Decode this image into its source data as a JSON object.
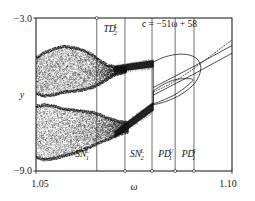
{
  "figure": {
    "name": "bifurcation-diagram",
    "background": "#ffffff",
    "ink": "#111111"
  },
  "annotation": {
    "equation": "c = −51ω + 58"
  },
  "axes": {
    "x": {
      "label": "ω",
      "min": 1.05,
      "max": 1.1,
      "tick_labels": [
        "1.05",
        "1.10"
      ],
      "ticks": [
        1.05,
        1.1
      ]
    },
    "y": {
      "label": "y",
      "min": -9.0,
      "max": -3.0,
      "tick_labels": [
        "−3.0",
        "−9.0"
      ],
      "ticks": [
        -3.0,
        -9.0
      ]
    }
  },
  "bifurcation_markers": [
    {
      "id": "TD2L",
      "base": "TD",
      "sub": "2",
      "sup": "L",
      "omega": 1.0655,
      "label_x": 1.0672,
      "label_y": -3.55,
      "line_from": -3.0,
      "line_to": -9.0,
      "tick_top": true,
      "tick_bottom": false
    },
    {
      "id": "SN1L",
      "base": "SN",
      "sub": "1",
      "sup": "L",
      "omega": 1.0727,
      "label_x": 1.06,
      "label_y": -8.45,
      "line_from": -3.0,
      "line_to": -9.0,
      "tick_top": false,
      "tick_bottom": true
    },
    {
      "id": "SN2L",
      "base": "SN",
      "sub": "2",
      "sup": "L",
      "omega": 1.0796,
      "label_x": 1.074,
      "label_y": -8.45,
      "line_from": -3.0,
      "line_to": -9.0,
      "tick_top": false,
      "tick_bottom": true
    },
    {
      "id": "PD1U",
      "base": "PD",
      "sub": "1",
      "sup": "U",
      "omega": 1.0855,
      "label_x": 1.0812,
      "label_y": -8.45,
      "line_from": -3.0,
      "line_to": -9.0,
      "tick_top": false,
      "tick_bottom": true
    },
    {
      "id": "PD1S",
      "base": "PD",
      "sub": "1",
      "sup": "S",
      "omega": 1.0903,
      "label_x": 1.0872,
      "label_y": -8.45,
      "line_from": -3.0,
      "line_to": -9.0,
      "tick_top": false,
      "tick_bottom": true
    }
  ],
  "chart_data": {
    "type": "scatter",
    "title": "",
    "xlabel": "ω",
    "ylabel": "y",
    "xlim": [
      1.05,
      1.1
    ],
    "ylim": [
      -9.0,
      -3.0
    ],
    "grid": false,
    "legend": null,
    "series": [
      {
        "name": "chaotic-attractor-upper-band",
        "style": "dense-cloud",
        "omega_range": [
          1.05,
          1.0735
        ],
        "y_range": [
          -3.95,
          -6.05
        ],
        "points": [
          {
            "omega": 1.05,
            "y_lo": -5.95,
            "y_hi": -4.55
          },
          {
            "omega": 1.052,
            "y_lo": -6.05,
            "y_hi": -4.35
          },
          {
            "omega": 1.0545,
            "y_lo": -6.0,
            "y_hi": -4.2
          },
          {
            "omega": 1.057,
            "y_lo": -5.9,
            "y_hi": -4.1
          },
          {
            "omega": 1.0595,
            "y_lo": -5.85,
            "y_hi": -4.15
          },
          {
            "omega": 1.062,
            "y_lo": -5.8,
            "y_hi": -4.25
          },
          {
            "omega": 1.0645,
            "y_lo": -5.7,
            "y_hi": -4.45
          },
          {
            "omega": 1.0665,
            "y_lo": -5.55,
            "y_hi": -4.7
          },
          {
            "omega": 1.0685,
            "y_lo": -5.35,
            "y_hi": -4.85
          },
          {
            "omega": 1.0705,
            "y_lo": -5.2,
            "y_hi": -4.92
          },
          {
            "omega": 1.073,
            "y_lo": -5.1,
            "y_hi": -4.95
          }
        ]
      },
      {
        "name": "chaotic-attractor-lower-band",
        "style": "dense-cloud",
        "omega_range": [
          1.05,
          1.0735
        ],
        "y_range": [
          -6.35,
          -8.6
        ],
        "points": [
          {
            "omega": 1.05,
            "y_lo": -8.45,
            "y_hi": -6.45
          },
          {
            "omega": 1.052,
            "y_lo": -8.55,
            "y_hi": -6.4
          },
          {
            "omega": 1.0545,
            "y_lo": -8.5,
            "y_hi": -6.45
          },
          {
            "omega": 1.057,
            "y_lo": -8.4,
            "y_hi": -6.55
          },
          {
            "omega": 1.0595,
            "y_lo": -8.3,
            "y_hi": -6.6
          },
          {
            "omega": 1.062,
            "y_lo": -8.15,
            "y_hi": -6.65
          },
          {
            "omega": 1.0645,
            "y_lo": -8.0,
            "y_hi": -6.7
          },
          {
            "omega": 1.0665,
            "y_lo": -7.85,
            "y_hi": -6.8
          },
          {
            "omega": 1.069,
            "y_lo": -7.7,
            "y_hi": -6.95
          },
          {
            "omega": 1.071,
            "y_lo": -7.55,
            "y_hi": -7.05
          },
          {
            "omega": 1.0735,
            "y_lo": -7.45,
            "y_hi": -7.1
          }
        ]
      },
      {
        "name": "period-2-band-upper",
        "style": "thick-band",
        "points": [
          {
            "omega": 1.07,
            "y_lo": -5.12,
            "y_hi": -4.88
          },
          {
            "omega": 1.074,
            "y_lo": -5.05,
            "y_hi": -4.78
          },
          {
            "omega": 1.078,
            "y_lo": -4.97,
            "y_hi": -4.7
          },
          {
            "omega": 1.08,
            "y_lo": -4.92,
            "y_hi": -4.66
          }
        ]
      },
      {
        "name": "period-2-band-lower",
        "style": "thick-band",
        "points": [
          {
            "omega": 1.07,
            "y_lo": -7.7,
            "y_hi": -7.45
          },
          {
            "omega": 1.074,
            "y_lo": -7.3,
            "y_hi": -6.98
          },
          {
            "omega": 1.078,
            "y_lo": -6.85,
            "y_hi": -6.52
          },
          {
            "omega": 1.08,
            "y_lo": -6.62,
            "y_hi": -6.3
          }
        ]
      },
      {
        "name": "outer-loop-solid",
        "style": "solid-curve",
        "points": [
          {
            "omega": 1.08,
            "y": -4.72
          },
          {
            "omega": 1.083,
            "y": -4.52
          },
          {
            "omega": 1.0865,
            "y": -4.42
          },
          {
            "omega": 1.0895,
            "y": -4.47
          },
          {
            "omega": 1.0915,
            "y": -4.68
          },
          {
            "omega": 1.092,
            "y": -5.05
          },
          {
            "omega": 1.0905,
            "y": -5.55
          },
          {
            "omega": 1.087,
            "y": -6.0
          },
          {
            "omega": 1.083,
            "y": -6.28
          },
          {
            "omega": 1.08,
            "y": -6.4
          }
        ]
      },
      {
        "name": "inner-loop-solid",
        "style": "solid-curve",
        "points": [
          {
            "omega": 1.08,
            "y": -5.85
          },
          {
            "omega": 1.0828,
            "y": -5.58
          },
          {
            "omega": 1.0855,
            "y": -5.42
          },
          {
            "omega": 1.088,
            "y": -5.38
          },
          {
            "omega": 1.09,
            "y": -5.45
          },
          {
            "omega": 1.086,
            "y": -5.95
          },
          {
            "omega": 1.082,
            "y": -6.25
          },
          {
            "omega": 1.08,
            "y": -6.36
          }
        ]
      },
      {
        "name": "unstable-branch-dotted",
        "style": "dotted-curve",
        "points": [
          {
            "omega": 1.08,
            "y": -5.9
          },
          {
            "omega": 1.084,
            "y": -5.6
          },
          {
            "omega": 1.088,
            "y": -5.22
          },
          {
            "omega": 1.092,
            "y": -4.78
          },
          {
            "omega": 1.096,
            "y": -4.32
          },
          {
            "omega": 1.1,
            "y": -3.86
          },
          {
            "omega": 1.102,
            "y": -3.62
          }
        ]
      },
      {
        "name": "stable-branch-upper-solid",
        "style": "solid-curve",
        "points": [
          {
            "omega": 1.08,
            "y": -5.72
          },
          {
            "omega": 1.085,
            "y": -5.32
          },
          {
            "omega": 1.09,
            "y": -4.92
          },
          {
            "omega": 1.095,
            "y": -4.5
          },
          {
            "omega": 1.1,
            "y": -4.08
          },
          {
            "omega": 1.103,
            "y": -3.82
          }
        ]
      },
      {
        "name": "stable-branch-lower-solid",
        "style": "solid-curve",
        "points": [
          {
            "omega": 1.08,
            "y": -6.02
          },
          {
            "omega": 1.085,
            "y": -5.62
          },
          {
            "omega": 1.09,
            "y": -5.22
          },
          {
            "omega": 1.095,
            "y": -4.8
          },
          {
            "omega": 1.1,
            "y": -4.38
          },
          {
            "omega": 1.103,
            "y": -4.12
          }
        ]
      }
    ]
  }
}
